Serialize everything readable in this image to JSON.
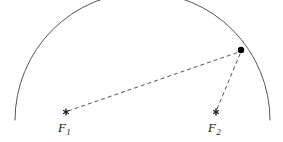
{
  "figure": {
    "type": "geometry-diagram",
    "background_color": "#ffffff",
    "stroke_color": "#555555",
    "dash_color": "#555555",
    "marker_color": "#1a1a1a",
    "point_color": "#000000",
    "label_color": "#1a1a1a"
  },
  "arc": {
    "name": "circular-arc",
    "center_x": 142,
    "center_y": 133,
    "radius": 120,
    "start_x": 15,
    "start_y": 120,
    "apex_x": 140,
    "apex_y": 13,
    "end_x": 270,
    "end_y": 120,
    "stroke_width": 1
  },
  "point_on_arc": {
    "name": "point-p",
    "x": 241,
    "y": 50,
    "radius": 3.2
  },
  "foci": [
    {
      "id": "f1",
      "label": "F",
      "subscript": "1",
      "marker_x": 66,
      "marker_y": 112,
      "label_x": 58,
      "label_y": 121
    },
    {
      "id": "f2",
      "label": "F",
      "subscript": "2",
      "marker_x": 216,
      "marker_y": 112,
      "label_x": 208,
      "label_y": 121
    }
  ],
  "dashed_segments": [
    {
      "id": "segment-f1-p",
      "from": "f1",
      "to": "point-p",
      "x1": 68,
      "y1": 111,
      "x2": 239,
      "y2": 52,
      "dash_pattern": "4 3"
    },
    {
      "id": "segment-f2-p",
      "from": "f2",
      "to": "point-p",
      "x1": 217,
      "y1": 109,
      "x2": 240,
      "y2": 54,
      "dash_pattern": "4 3"
    }
  ]
}
